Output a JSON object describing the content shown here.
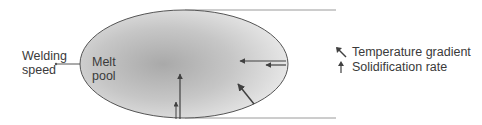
{
  "diagram": {
    "welding_speed_label": [
      "Welding",
      "speed"
    ],
    "melt_pool_label": [
      "Melt",
      "pool"
    ],
    "legend": [
      {
        "icon": "diagonal-arrow-icon",
        "label": "Temperature gradient"
      },
      {
        "icon": "up-arrow-icon",
        "label": "Solidification rate"
      }
    ],
    "colors": {
      "pool_center": "#a9a9a9",
      "pool_edge": "#e6e6e6",
      "outline": "#555555",
      "arrow": "#404040",
      "guide_lines": "#9a9a9a"
    }
  }
}
